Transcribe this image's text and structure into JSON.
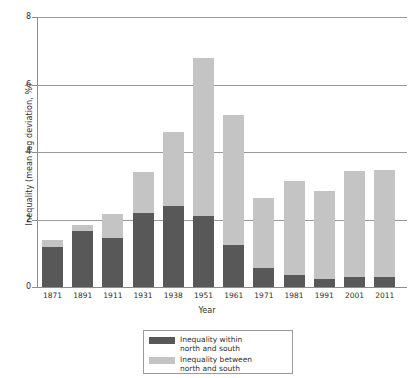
{
  "chart_data": {
    "type": "bar",
    "stacked": true,
    "title": "",
    "xlabel": "Year",
    "ylabel": "Inequality (mean log deviation, %)",
    "ylim": [
      0,
      8
    ],
    "yticks": [
      0,
      2,
      4,
      6,
      8
    ],
    "grid": true,
    "legend_position": "bottom-center",
    "categories": [
      "1871",
      "1891",
      "1911",
      "1931",
      "1938",
      "1951",
      "1961",
      "1971",
      "1981",
      "1991",
      "2001",
      "2011"
    ],
    "series": [
      {
        "name": "Inequality within north and south",
        "color": "#585858",
        "values": [
          1.2,
          1.65,
          1.45,
          2.2,
          2.4,
          2.1,
          1.25,
          0.55,
          0.35,
          0.25,
          0.3,
          0.3
        ]
      },
      {
        "name": "Inequality between north and south",
        "color": "#c4c4c4",
        "values": [
          0.2,
          0.2,
          0.7,
          1.2,
          2.2,
          4.7,
          3.85,
          2.1,
          2.8,
          2.6,
          3.15,
          3.18
        ]
      }
    ],
    "totals": [
      1.4,
      1.85,
      2.15,
      3.4,
      4.6,
      6.8,
      5.1,
      2.65,
      3.15,
      2.85,
      3.45,
      3.48
    ]
  },
  "legend": {
    "entries": [
      {
        "label_line1": "Inequality within",
        "label_line2": "north and south",
        "swatch": "within-swatch"
      },
      {
        "label_line1": "Inequality between",
        "label_line2": "north and south",
        "swatch": "between-swatch"
      }
    ]
  }
}
